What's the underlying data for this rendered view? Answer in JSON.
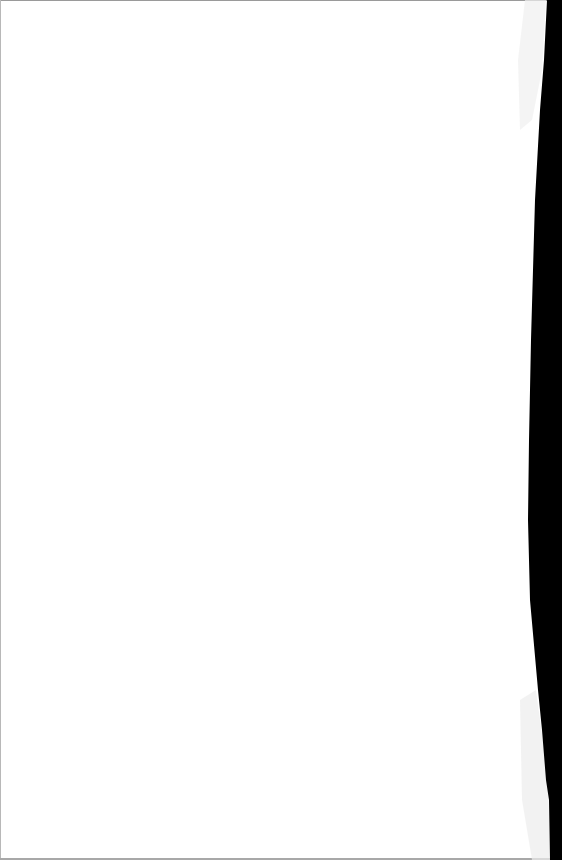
{
  "document": {
    "type": "scanned-page",
    "content": "",
    "colors": {
      "paper": "#ffffff",
      "scan_edge": "#000000",
      "border": "#9a9a9a",
      "edge_speckle": "#e6e6e6"
    }
  }
}
